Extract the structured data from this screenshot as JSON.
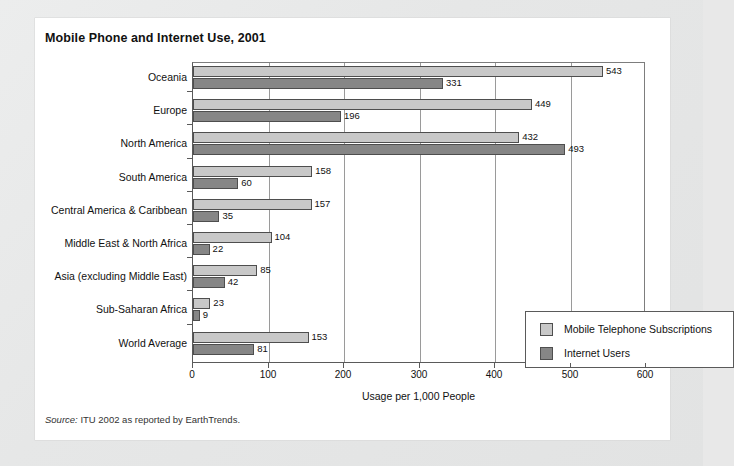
{
  "card": {
    "title": "Mobile Phone and Internet Use, 2001",
    "source_label": "Source:",
    "source_text": " ITU 2002 as reported by EarthTrends."
  },
  "chart_data": {
    "type": "bar",
    "orientation": "horizontal",
    "title": "Mobile Phone and Internet Use, 2001",
    "xlabel": "Usage per 1,000 People",
    "ylabel": "",
    "xlim": [
      0,
      600
    ],
    "xticks": [
      0,
      100,
      200,
      300,
      400,
      500,
      600
    ],
    "xtick_labels": [
      "0",
      "100",
      "200",
      "300",
      "400",
      "500",
      "600"
    ],
    "grid": "vertical",
    "legend_position": "inside-lower-right",
    "categories": [
      "Oceania",
      "Europe",
      "North America",
      "South America",
      "Central America & Caribbean",
      "Middle East & North Africa",
      "Asia (excluding Middle East)",
      "Sub-Saharan Africa",
      "World Average"
    ],
    "series": [
      {
        "name": "Mobile Telephone Subscriptions",
        "color": "#c8c8c8",
        "values": [
          543,
          449,
          432,
          158,
          157,
          104,
          85,
          23,
          153
        ]
      },
      {
        "name": "Internet Users",
        "color": "#868686",
        "values": [
          331,
          196,
          493,
          60,
          35,
          22,
          42,
          9,
          81
        ]
      }
    ]
  }
}
